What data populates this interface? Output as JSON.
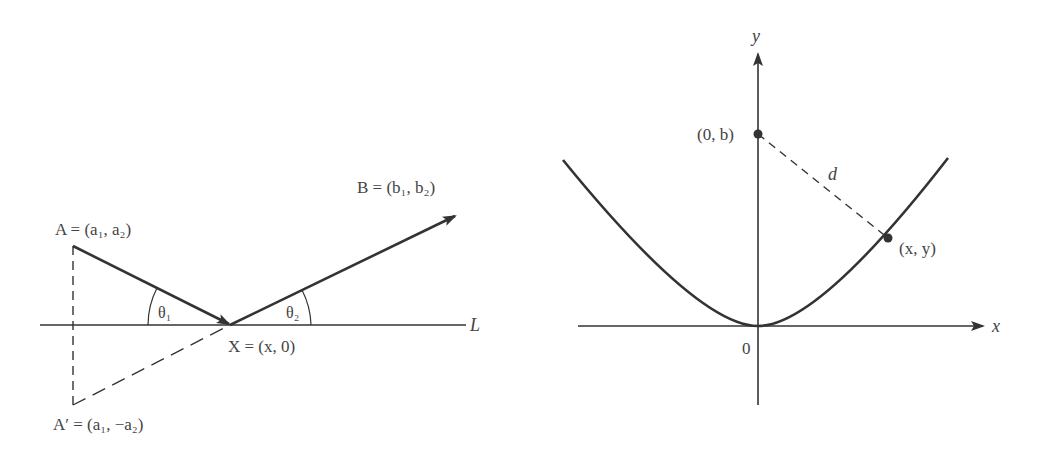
{
  "left_figure": {
    "title": "Reflection path on line L",
    "labels": {
      "A": "A = (a₁, a₂)",
      "B": "B = (b₁, b₂)",
      "X": "X = (x, 0)",
      "A_prime": "A′ = (a₁, −a₂)",
      "L": "L",
      "theta1": "θ₁",
      "theta2": "θ₂"
    },
    "points": {
      "A": [
        73,
        246
      ],
      "X": [
        230,
        325
      ],
      "B_tip": [
        456,
        215
      ],
      "A_prime": [
        73,
        405
      ]
    }
  },
  "right_figure": {
    "title": "Distance from (0, b) to point on parabola",
    "labels": {
      "y_axis": "y",
      "x_axis": "x",
      "origin": "0",
      "point_0b": "(0, b)",
      "point_xy": "(x, y)",
      "distance": "d"
    }
  },
  "colors": {
    "stroke": "#333333",
    "text": "#444444",
    "background": "#ffffff"
  }
}
